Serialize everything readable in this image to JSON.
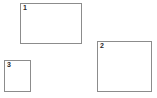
{
  "canvas": {
    "width": 157,
    "height": 98,
    "background_color": "#ffffff",
    "description": "Bounding box region overlay"
  },
  "style": {
    "border_color": "#8c8c8c",
    "border_width": 1,
    "label_color": "#2a2a2a",
    "fill_color": "transparent"
  },
  "regions": [
    {
      "label": "1",
      "x": 20,
      "y": 3,
      "width": 62,
      "height": 41
    },
    {
      "label": "2",
      "x": 97,
      "y": 41,
      "width": 55,
      "height": 51
    },
    {
      "label": "3",
      "x": 4,
      "y": 60,
      "width": 27,
      "height": 32
    }
  ]
}
